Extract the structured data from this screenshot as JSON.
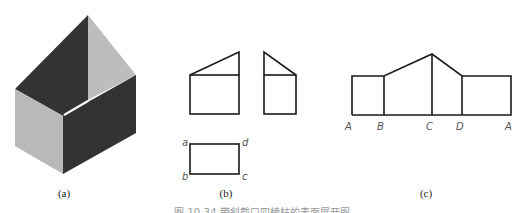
{
  "figure": {
    "caption": "图 10-34  带斜截口四棱柱的表面展开图",
    "colors": {
      "dark_face": "#333333",
      "light_face": "#b9b9b9",
      "light_gable": "#bdbdbd",
      "line": "#1a1a1a",
      "label": "#555555"
    },
    "panels": {
      "a": {
        "label": "(a)",
        "description": "isometric shaded view of prism with sloped cut"
      },
      "b": {
        "label": "(b)",
        "description": "orthographic views: front, side, top",
        "top_view_labels": [
          "a",
          "d",
          "b",
          "c"
        ]
      },
      "c": {
        "label": "(c)",
        "description": "surface development",
        "bottom_labels": [
          "A",
          "B",
          "C",
          "D",
          "A"
        ]
      }
    }
  }
}
